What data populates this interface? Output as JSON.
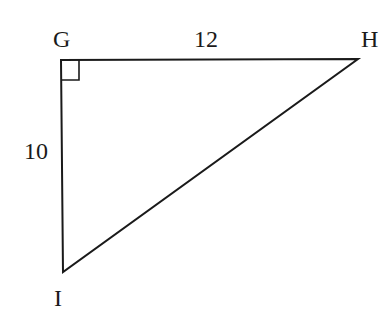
{
  "diagram": {
    "type": "right-triangle",
    "vertices": {
      "G": {
        "label": "G",
        "x": 61,
        "y": 60
      },
      "H": {
        "label": "H",
        "x": 358,
        "y": 59
      },
      "I": {
        "label": "I",
        "x": 63,
        "y": 272
      }
    },
    "sides": {
      "GH": {
        "label": "12"
      },
      "GI": {
        "label": "10"
      }
    },
    "right_angle_at": "G",
    "stroke_color": "#1a1a1a"
  }
}
